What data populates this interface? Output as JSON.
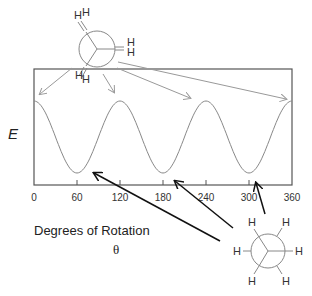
{
  "chart_data": {
    "type": "line",
    "title": "",
    "xlabel": "Degrees of Rotation",
    "xlabel_symbol": "θ",
    "ylabel": "E",
    "xlim": [
      0,
      360
    ],
    "x_ticks": [
      0,
      60,
      120,
      180,
      240,
      300,
      360
    ],
    "x_tick_labels": [
      "0",
      "60",
      "120",
      "180",
      "240",
      "300",
      "360"
    ],
    "grid": false,
    "series": [
      {
        "name": "Torsional energy",
        "x": [
          0,
          60,
          120,
          180,
          240,
          300,
          360
        ],
        "values": [
          1,
          0,
          1,
          0,
          1,
          0,
          1
        ],
        "note": "relative energy; maxima at eclipsed (0,120,240,360), minima at staggered (60,180,300)"
      }
    ],
    "annotations": [
      {
        "label": "eclipsed conformation (Newman projection)",
        "points_to": [
          0,
          120,
          240,
          360
        ]
      },
      {
        "label": "staggered conformation (Newman projection)",
        "points_to": [
          60,
          180,
          300
        ]
      }
    ]
  },
  "diagram": {
    "eclipsed_newman": {
      "atom_labels": [
        "H",
        "H",
        "H",
        "H",
        "H",
        "H"
      ]
    },
    "staggered_newman": {
      "atom_labels": [
        "H",
        "H",
        "H",
        "H",
        "H",
        "H"
      ]
    },
    "colors": {
      "curve": "#888888",
      "frame": "#555555",
      "gray_arrow": "#999999",
      "black_arrow": "#111111"
    }
  }
}
